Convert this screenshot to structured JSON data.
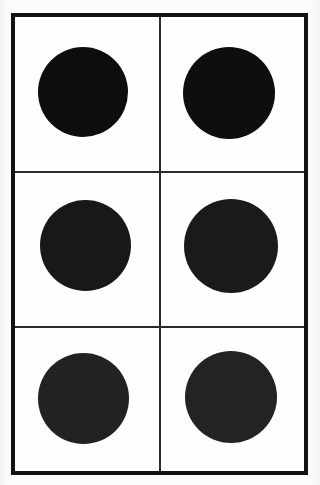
{
  "figure": {
    "background_color": "#fbfbf9",
    "plate_color": "#fefefe",
    "frame": {
      "color": "#121212",
      "thickness_px": 4,
      "left_px": 11,
      "top_px": 13,
      "width_px": 297,
      "height_px": 462
    },
    "grid": {
      "columns": 2,
      "rows": 3,
      "total_cells": 6,
      "divider_color": "#2b2b2b",
      "divider_thickness_px": 2,
      "horizontal_divider_y_px": [
        171,
        326
      ],
      "vertical_divider_x_px": [
        159
      ]
    },
    "circles": [
      {
        "id": "circle-r1c1",
        "label": "Top left circle",
        "row": 1,
        "column": 1,
        "center_x_px": 83,
        "center_y_px": 92,
        "diameter_px": 90,
        "color": "#0d0d0d"
      },
      {
        "id": "circle-r1c2",
        "label": "Top right circle",
        "row": 1,
        "column": 2,
        "center_x_px": 229,
        "center_y_px": 93,
        "diameter_px": 92,
        "color": "#0e0e0e"
      },
      {
        "id": "circle-r2c1",
        "label": "Middle left circle",
        "row": 2,
        "column": 1,
        "center_x_px": 85,
        "center_y_px": 245,
        "diameter_px": 91,
        "color": "#181818"
      },
      {
        "id": "circle-r2c2",
        "label": "Middle right circle",
        "row": 2,
        "column": 2,
        "center_x_px": 231,
        "center_y_px": 246,
        "diameter_px": 94,
        "color": "#1a1a1a"
      },
      {
        "id": "circle-r3c1",
        "label": "Bottom left circle",
        "row": 3,
        "column": 1,
        "center_x_px": 83,
        "center_y_px": 398,
        "diameter_px": 91,
        "color": "#222222"
      },
      {
        "id": "circle-r3c2",
        "label": "Bottom right circle",
        "row": 3,
        "column": 2,
        "center_x_px": 231,
        "center_y_px": 397,
        "diameter_px": 92,
        "color": "#232323"
      }
    ]
  }
}
